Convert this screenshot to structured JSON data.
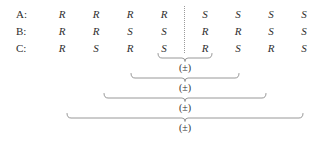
{
  "figure": {
    "type": "stereochemistry-configuration-table",
    "rows": [
      {
        "label": "A:",
        "values": [
          "R",
          "R",
          "R",
          "R",
          "S",
          "S",
          "S",
          "S"
        ]
      },
      {
        "label": "B:",
        "values": [
          "R",
          "R",
          "S",
          "S",
          "R",
          "R",
          "S",
          "S"
        ]
      },
      {
        "label": "C:",
        "values": [
          "R",
          "S",
          "R",
          "S",
          "R",
          "S",
          "R",
          "S"
        ]
      }
    ],
    "column_count": 8,
    "mirror_divider": {
      "style": "dotted",
      "after_column": 4
    },
    "braces": [
      {
        "label": "(±)",
        "start_column": 4,
        "end_column": 5
      },
      {
        "label": "(±)",
        "start_column": 3,
        "end_column": 6
      },
      {
        "label": "(±)",
        "start_column": 2,
        "end_column": 7
      },
      {
        "label": "(±)",
        "start_column": 1,
        "end_column": 8
      }
    ],
    "colors": {
      "text": "#2e2e2e",
      "rule": "#8c8c8c",
      "divider": "#9a9a9a",
      "background": "#ffffff"
    }
  }
}
